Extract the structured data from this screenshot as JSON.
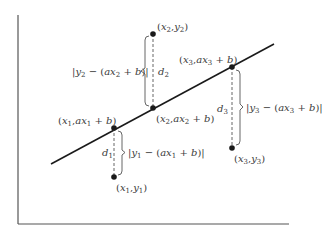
{
  "diagram": {
    "type": "linear-regression-residuals",
    "axes": {
      "x_axis": {
        "x1": 18,
        "y1": 224,
        "x2": 289,
        "y2": 224
      },
      "y_axis": {
        "x1": 18,
        "y1": 15,
        "x2": 18,
        "y2": 224
      }
    },
    "fit_line": {
      "x1": 51,
      "y1": 164,
      "x2": 274,
      "y2": 44,
      "equation": "y = ax + b"
    },
    "colors": {
      "line": "#1a1a1a",
      "axis": "#555555",
      "point": "#1a1a1a",
      "brace": "#555555",
      "dash": "#555555",
      "text": "#3a3a3a"
    },
    "points": [
      {
        "id": "p1",
        "observed": {
          "x": 114,
          "y": 177,
          "label": "(x1, y1)"
        },
        "fitted": {
          "x": 114,
          "y": 128,
          "label": "(x1, ax1 + b)"
        },
        "distance_label": "d1",
        "residual_label": "|y1 − (ax1 + b)|"
      },
      {
        "id": "p2",
        "observed": {
          "x": 153,
          "y": 34,
          "label": "(x2, y2)"
        },
        "fitted": {
          "x": 153,
          "y": 108,
          "label": "(x2, ax2 + b)"
        },
        "distance_label": "d2",
        "residual_label": "|y2 − (ax2 + b)|"
      },
      {
        "id": "p3",
        "observed": {
          "x": 232,
          "y": 148,
          "label": "(x3, y3)"
        },
        "fitted": {
          "x": 232,
          "y": 67,
          "label": "(x3, ax3 + b)"
        },
        "distance_label": "d3",
        "residual_label": "|y3 − (ax3 + b)|"
      }
    ]
  }
}
